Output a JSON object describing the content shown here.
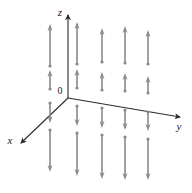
{
  "figure": {
    "title": "",
    "type": "3d-vector-field-diagram",
    "background_color": "#ffffff",
    "width": 192,
    "height": 193
  },
  "axes": {
    "origin_label": "0",
    "origin": {
      "x": 68,
      "y": 98
    },
    "color": "#2b2b2b",
    "items": [
      {
        "name": "z",
        "label": "z",
        "label_x": 60,
        "label_y": 16,
        "from": {
          "x": 68,
          "y": 98
        },
        "to": {
          "x": 68,
          "y": 15
        },
        "arrowhead": true
      },
      {
        "name": "y",
        "label": "y",
        "label_x": 179,
        "label_y": 130,
        "from": {
          "x": 68,
          "y": 98
        },
        "to": {
          "x": 180,
          "y": 117
        },
        "arrowhead": true
      },
      {
        "name": "x",
        "label": "x",
        "label_x": 10,
        "label_y": 144,
        "from": {
          "x": 68,
          "y": 98
        },
        "to": {
          "x": 21,
          "y": 143
        },
        "arrowhead": true
      }
    ]
  },
  "vector_field": {
    "color": "#8a8a8a",
    "shaft_width": 1.6,
    "head_width": 5.0,
    "head_length": 7.0,
    "tail_dot_radius": 1.6,
    "description": "Vertical vectors pointing away from the xy-plane: upward above the plane, downward below the plane",
    "columns_x": [
      50,
      77,
      102,
      125,
      148
    ],
    "rows": [
      {
        "name": "upper-long-row",
        "direction": "up",
        "length": "long",
        "tail_y": 65,
        "tip_y": 22
      },
      {
        "name": "upper-short-row",
        "direction": "up",
        "length": "short",
        "tail_y": 90,
        "tip_y": 70
      },
      {
        "name": "lower-short-row",
        "direction": "down",
        "length": "short",
        "tail_y": 105,
        "tip_y": 126
      },
      {
        "name": "lower-long-row",
        "direction": "down",
        "length": "long",
        "tail_y": 133,
        "tip_y": 179
      }
    ],
    "arrows": [
      {
        "col": 0,
        "x": 50,
        "row": "upper-long-row",
        "tail_y": 66,
        "tip_y": 24,
        "direction": "up"
      },
      {
        "col": 1,
        "x": 77,
        "row": "upper-long-row",
        "tail_y": 64,
        "tip_y": 22,
        "direction": "up"
      },
      {
        "col": 2,
        "x": 102,
        "row": "upper-long-row",
        "tail_y": 62,
        "tip_y": 28,
        "direction": "up"
      },
      {
        "col": 3,
        "x": 125,
        "row": "upper-long-row",
        "tail_y": 63,
        "tip_y": 26,
        "direction": "up"
      },
      {
        "col": 4,
        "x": 148,
        "row": "upper-long-row",
        "tail_y": 64,
        "tip_y": 30,
        "direction": "up"
      },
      {
        "col": 0,
        "x": 50,
        "row": "upper-short-row",
        "tail_y": 89,
        "tip_y": 70,
        "direction": "up"
      },
      {
        "col": 1,
        "x": 77,
        "row": "upper-short-row",
        "tail_y": 88,
        "tip_y": 69,
        "direction": "up"
      },
      {
        "col": 2,
        "x": 102,
        "row": "upper-short-row",
        "tail_y": 90,
        "tip_y": 72,
        "direction": "up"
      },
      {
        "col": 3,
        "x": 125,
        "row": "upper-short-row",
        "tail_y": 91,
        "tip_y": 73,
        "direction": "up"
      },
      {
        "col": 4,
        "x": 148,
        "row": "upper-short-row",
        "tail_y": 93,
        "tip_y": 76,
        "direction": "up"
      },
      {
        "col": 0,
        "x": 50,
        "row": "lower-short-row",
        "tail_y": 103,
        "tip_y": 123,
        "direction": "down"
      },
      {
        "col": 1,
        "x": 77,
        "row": "lower-short-row",
        "tail_y": 106,
        "tip_y": 126,
        "direction": "down"
      },
      {
        "col": 2,
        "x": 102,
        "row": "lower-short-row",
        "tail_y": 108,
        "tip_y": 128,
        "direction": "down"
      },
      {
        "col": 3,
        "x": 125,
        "row": "lower-short-row",
        "tail_y": 110,
        "tip_y": 130,
        "direction": "down"
      },
      {
        "col": 4,
        "x": 148,
        "row": "lower-short-row",
        "tail_y": 112,
        "tip_y": 131,
        "direction": "down"
      },
      {
        "col": 0,
        "x": 50,
        "row": "lower-long-row",
        "tail_y": 130,
        "tip_y": 172,
        "direction": "down"
      },
      {
        "col": 1,
        "x": 77,
        "row": "lower-long-row",
        "tail_y": 133,
        "tip_y": 176,
        "direction": "down"
      },
      {
        "col": 2,
        "x": 102,
        "row": "lower-long-row",
        "tail_y": 135,
        "tip_y": 179,
        "direction": "down"
      },
      {
        "col": 3,
        "x": 125,
        "row": "lower-long-row",
        "tail_y": 137,
        "tip_y": 180,
        "direction": "down"
      },
      {
        "col": 4,
        "x": 148,
        "row": "lower-long-row",
        "tail_y": 139,
        "tip_y": 180,
        "direction": "down"
      }
    ]
  }
}
